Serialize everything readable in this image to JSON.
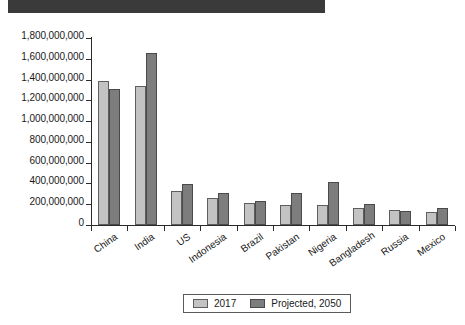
{
  "title_band": {
    "text": ""
  },
  "chart_data": {
    "type": "bar",
    "title": "",
    "subtitle": "",
    "xlabel": "",
    "ylabel": "",
    "ylim": [
      0,
      1800000000
    ],
    "grid": false,
    "legend_position": "bottom",
    "categories": [
      "China",
      "India",
      "US",
      "Indonesia",
      "Brazil",
      "Pakistan",
      "Nigeria",
      "Bangladesh",
      "Russia",
      "Mexico"
    ],
    "ytick_values": [
      1800000000,
      1600000000,
      1400000000,
      1200000000,
      1000000000,
      800000000,
      600000000,
      400000000,
      200000000,
      0
    ],
    "ytick_labels": [
      "1,800,000,000",
      "1,600,000,000",
      "1,400,000,000",
      "1,200,000,000",
      "1,000,000,000",
      "800,000,000",
      "600,000,000",
      "400,000,000",
      "200,000,000",
      "0"
    ],
    "series": [
      {
        "name": "2017",
        "color": "#c3c3c3",
        "values": [
          1390000000,
          1340000000,
          325000000,
          264000000,
          209000000,
          197000000,
          191000000,
          165000000,
          144000000,
          129000000
        ]
      },
      {
        "name": "Projected, 2050",
        "color": "#7d7d7d",
        "values": [
          1310000000,
          1660000000,
          390000000,
          306000000,
          233000000,
          307000000,
          411000000,
          202000000,
          133000000,
          164000000
        ]
      }
    ]
  },
  "legend": {
    "entries": [
      {
        "label": "2017",
        "swatch": "s2017"
      },
      {
        "label": "Projected, 2050",
        "swatch": "s2050"
      }
    ]
  }
}
